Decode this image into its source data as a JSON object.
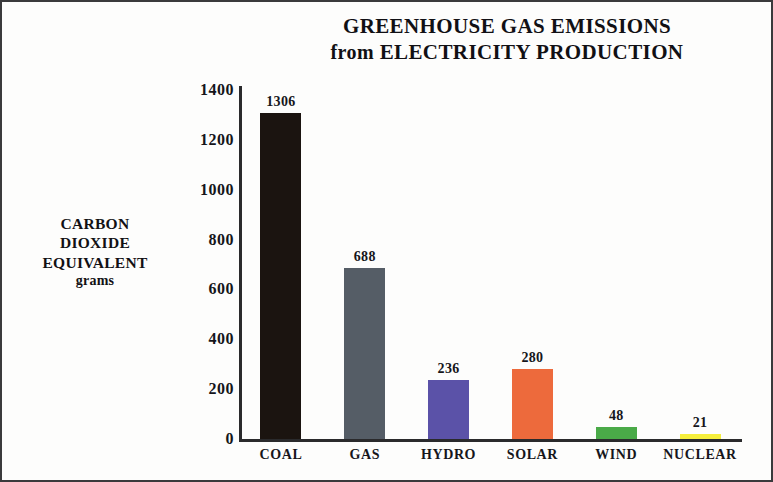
{
  "chart_data": {
    "type": "bar",
    "title": "GREENHOUSE GAS EMISSIONS from ELECTRICITY PRODUCTION",
    "title_line1": "GREENHOUSE GAS EMISSIONS",
    "title_line2_lead": "from",
    "title_line2_rest": "ELECTRICITY PRODUCTION",
    "xlabel": "",
    "ylabel": "CARBON DIOXIDE EQUIVALENT grams",
    "ylabel_line1": "CARBON",
    "ylabel_line2": "DIOXIDE",
    "ylabel_line3": "EQUIVALENT",
    "ylabel_units": "grams",
    "categories": [
      "COAL",
      "GAS",
      "HYDRO",
      "SOLAR",
      "WIND",
      "NUCLEAR"
    ],
    "values": [
      1306,
      688,
      236,
      280,
      48,
      21
    ],
    "bar_colors": [
      "#1b1410",
      "#555d66",
      "#5b52a8",
      "#ed6a3c",
      "#4aaa48",
      "#f5ee3c"
    ],
    "ylim": [
      0,
      1400
    ],
    "yticks": [
      1400,
      1200,
      1000,
      800,
      600,
      400,
      200,
      0
    ],
    "ytick_labels": [
      "1400",
      "1200",
      "1000",
      "800",
      "600",
      "400",
      "200",
      "0"
    ],
    "grid": false,
    "legend": "none",
    "value_labels": [
      "1306",
      "688",
      "236",
      "280",
      "48",
      "21"
    ],
    "bars": [
      {
        "category": "COAL",
        "value": 1306,
        "label": "1306",
        "color": "#1b1410"
      },
      {
        "category": "GAS",
        "value": 688,
        "label": "688",
        "color": "#555d66"
      },
      {
        "category": "HYDRO",
        "value": 236,
        "label": "236",
        "color": "#5b52a8"
      },
      {
        "category": "SOLAR",
        "value": 280,
        "label": "280",
        "color": "#ed6a3c"
      },
      {
        "category": "WIND",
        "value": 48,
        "label": "48",
        "color": "#4aaa48"
      },
      {
        "category": "NUCLEAR",
        "value": 21,
        "label": "21",
        "color": "#f5ee3c"
      }
    ]
  },
  "frame": {
    "border_color": "#3a3a3c",
    "axis_color": "#2a2a2c",
    "background": "#fdfdfc"
  }
}
